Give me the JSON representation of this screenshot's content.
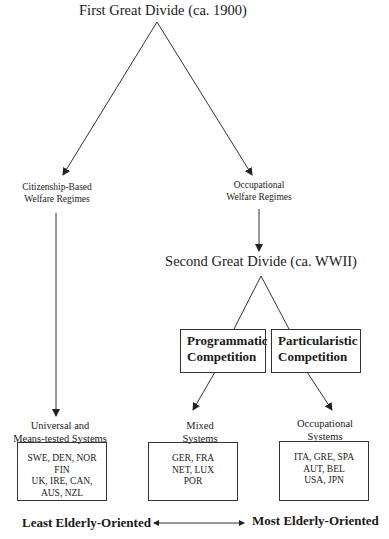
{
  "first_divide": {
    "title": "First Great Divide (ca. 1900)",
    "left_branch": {
      "line1": "Citizenship-Based",
      "line2": "Welfare Regimes"
    },
    "right_branch": {
      "line1": "Occupational",
      "line2": "Welfare Regimes"
    }
  },
  "second_divide": {
    "title": "Second Great Divide (ca. WWII)",
    "left_box": {
      "line1": "Programmatic",
      "line2": "Competition"
    },
    "right_box": {
      "line1": "Particularistic",
      "line2": "Competition"
    }
  },
  "outcomes": [
    {
      "label_line1": "Universal and",
      "label_line2": "Means-tested Systems",
      "countries": [
        "SWE, DEN, NOR",
        "FIN",
        "UK, IRE, CAN,",
        "AUS, NZL"
      ]
    },
    {
      "label_line1": "Mixed",
      "label_line2": "Systems",
      "countries": [
        "GER, FRA",
        "NET, LUX",
        "POR"
      ]
    },
    {
      "label_line1": "Occupational",
      "label_line2": "Systems",
      "countries": [
        "ITA, GRE, SPA",
        "AUT, BEL",
        "USA, JPN"
      ]
    }
  ],
  "scale": {
    "left_label": "Least Elderly-Oriented",
    "right_label": "Most Elderly-Oriented"
  },
  "colors": {
    "line": "#333333",
    "text": "#1a1a1a",
    "background": "#ffffff"
  }
}
